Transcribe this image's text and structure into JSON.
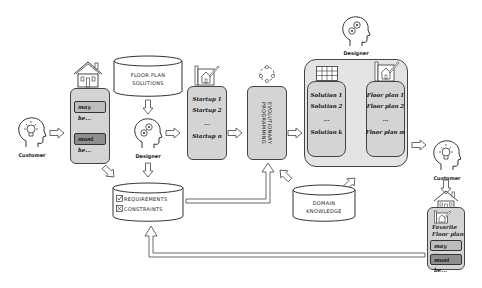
{
  "actors": {
    "customer_left": "Customer",
    "designer_center": "Designer",
    "designer_top": "Designer",
    "customer_right": "Customer"
  },
  "preference_box": {
    "may_be": "may be...",
    "must_be": "must be..."
  },
  "floor_plan_solutions": {
    "line1": "FLOOR PLAN",
    "line2": "SOLUTIONS"
  },
  "requirements_db": {
    "requirements": "REQUIREMENTS",
    "constraints": "CONSTRAINTS"
  },
  "startup_box": {
    "items": [
      "Startup 1",
      "Startup 2",
      "...",
      "Startup n"
    ]
  },
  "evolutionary": {
    "line1": "EVOLUTIONARY",
    "line2": "PROGRAMMING"
  },
  "solutions_box": {
    "items": [
      "Solution 1",
      "Solution 2",
      "...",
      "Solution k"
    ]
  },
  "floorplans_box": {
    "items": [
      "Floor plan 1",
      "Floor plan 2",
      "...",
      "Floor plan m"
    ]
  },
  "domain_knowledge": {
    "line1": "DOMAIN",
    "line2": "KNOWLEDGE"
  },
  "favorite_box": {
    "title1": "Favorite",
    "title2": "Floor plan",
    "may_be": "may be...",
    "must_be": "must be..."
  },
  "colors": {
    "box_fill": "#d4d4d4",
    "may_fill": "#bdbdbd",
    "must_fill": "#8e8e8e",
    "stroke": "#444444"
  }
}
